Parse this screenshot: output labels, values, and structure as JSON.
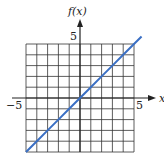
{
  "chart_data": {
    "type": "line",
    "title": "",
    "xlabel": "x",
    "ylabel": "f(x)",
    "xlim": [
      -5,
      5
    ],
    "ylim": [
      -5,
      5
    ],
    "x_tick_labels": [
      "-5",
      "5"
    ],
    "y_tick_labels": [
      "5"
    ],
    "grid": true,
    "grid_step": 1,
    "series": [
      {
        "name": "f(x) = x",
        "color": "#3a6fc4",
        "x": [
          -5,
          -4,
          -3,
          -2,
          -1,
          0,
          1,
          2,
          3,
          4,
          5,
          5.7
        ],
        "y": [
          -5,
          -4,
          -3,
          -2,
          -1,
          0,
          1,
          2,
          3,
          4,
          5,
          5.7
        ]
      }
    ]
  },
  "labels": {
    "y_axis": "f(x)",
    "x_axis": "x",
    "x_min": "−5",
    "x_max": "5",
    "y_max": "5"
  }
}
